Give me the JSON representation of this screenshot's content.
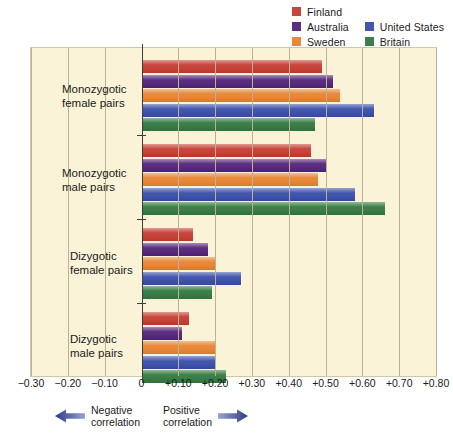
{
  "legend": {
    "items": [
      {
        "label": "Finland",
        "color": "#c8453c"
      },
      {
        "label": "Australia",
        "color": "#5b2d7e"
      },
      {
        "label": "United States",
        "color": "#4356ad"
      },
      {
        "label": "Sweden",
        "color": "#e8883a"
      },
      {
        "label": "Britain",
        "color": "#3c7f4a"
      }
    ]
  },
  "axis": {
    "ticks": [
      "−0.30",
      "−0.20",
      "−0.10",
      "0",
      "+0.10",
      "+0.20",
      "+0.30",
      "+0.40",
      "+0.50",
      "+0.60",
      "+0.70",
      "+0.80"
    ],
    "negative_note": "Negative\ncorrelation",
    "positive_note": "Positive\ncorrelation"
  },
  "chart_data": {
    "type": "bar",
    "orientation": "horizontal",
    "title": "",
    "xlabel": "",
    "ylabel": "",
    "xlim": [
      -0.3,
      0.8
    ],
    "xticks": [
      -0.3,
      -0.2,
      -0.1,
      0,
      0.1,
      0.2,
      0.3,
      0.4,
      0.5,
      0.6,
      0.7,
      0.8
    ],
    "grid": true,
    "legend_position": "top-right",
    "categories": [
      "Monozygotic\nfemale pairs",
      "Monozygotic\nmale pairs",
      "Dizygotic\nfemale pairs",
      "Dizygotic\nmale pairs"
    ],
    "series": [
      {
        "name": "Finland",
        "color": "#c8453c",
        "values": [
          0.49,
          0.46,
          0.14,
          0.13
        ]
      },
      {
        "name": "Australia",
        "color": "#5b2d7e",
        "values": [
          0.52,
          0.5,
          0.18,
          0.11
        ]
      },
      {
        "name": "Sweden",
        "color": "#e8883a",
        "values": [
          0.54,
          0.48,
          0.2,
          0.2
        ]
      },
      {
        "name": "United States",
        "color": "#4356ad",
        "values": [
          0.63,
          0.58,
          0.27,
          0.2
        ]
      },
      {
        "name": "Britain",
        "color": "#3c7f4a",
        "values": [
          0.47,
          0.66,
          0.19,
          0.23
        ]
      }
    ]
  }
}
